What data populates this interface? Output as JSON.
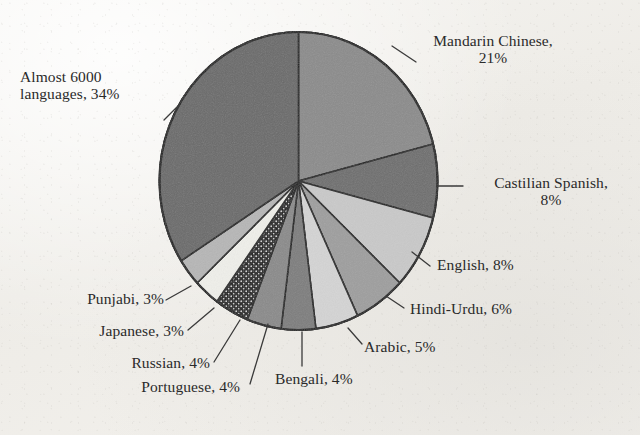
{
  "chart_data": {
    "type": "pie",
    "title": "",
    "subtitle": "",
    "xlabel": "",
    "ylabel": "",
    "legend_position": "callout-labels",
    "grid": false,
    "units": "percent",
    "start_angle_deg": 0,
    "direction": "clockwise",
    "categories": [
      "Mandarin Chinese",
      "Castilian Spanish",
      "English",
      "Hindi-Urdu",
      "Arabic",
      "Bengali",
      "Portuguese",
      "Russian",
      "Japanese",
      "Punjabi",
      "Almost 6000 languages"
    ],
    "values": [
      21,
      8,
      8,
      6,
      5,
      4,
      4,
      4,
      3,
      3,
      34
    ],
    "slices": [
      {
        "label": "Mandarin Chinese",
        "value": 21,
        "text": "Mandarin Chinese,",
        "text2": "21%",
        "fill": "#8b8b8b",
        "pattern": "solid"
      },
      {
        "label": "Castilian Spanish",
        "value": 8,
        "text": "Castilian Spanish,",
        "text2": "8%",
        "fill": "#6e6e6e",
        "pattern": "solid"
      },
      {
        "label": "English",
        "value": 8,
        "text": "English, 8%",
        "text2": "",
        "fill": "#c9c9c9",
        "pattern": "solid"
      },
      {
        "label": "Hindi-Urdu",
        "value": 6,
        "text": "Hindi-Urdu, 6%",
        "text2": "",
        "fill": "#9e9e9e",
        "pattern": "solid"
      },
      {
        "label": "Arabic",
        "value": 5,
        "text": "Arabic, 5%",
        "text2": "",
        "fill": "#d4d4d4",
        "pattern": "solid"
      },
      {
        "label": "Bengali",
        "value": 4,
        "text": "Bengali, 4%",
        "text2": "",
        "fill": "#7d7d7d",
        "pattern": "solid"
      },
      {
        "label": "Portuguese",
        "value": 4,
        "text": "Portuguese, 4%",
        "text2": "",
        "fill": "#8a8a8a",
        "pattern": "solid"
      },
      {
        "label": "Russian",
        "value": 4,
        "text": "Russian, 4%",
        "text2": "",
        "fill": "#1a1a1a",
        "pattern": "dotted-black"
      },
      {
        "label": "Japanese",
        "value": 3,
        "text": "Japanese, 3%",
        "text2": "",
        "fill": "#efefea",
        "pattern": "solid"
      },
      {
        "label": "Punjabi",
        "value": 3,
        "text": "Punjabi, 3%",
        "text2": "",
        "fill": "#b6b6b6",
        "pattern": "solid"
      },
      {
        "label": "Almost 6000 languages",
        "value": 34,
        "text": "Almost 6000",
        "text2": "languages, 34%",
        "fill": "#6a6a6a",
        "pattern": "solid"
      }
    ]
  },
  "labels": {
    "mandarin_line1": "Mandarin Chinese,",
    "mandarin_line2": "21%",
    "almost_line1": "Almost 6000",
    "almost_line2": "languages, 34%",
    "castilian_line1": "Castilian Spanish,",
    "castilian_line2": "8%",
    "english": "English, 8%",
    "hindi_urdu": "Hindi-Urdu, 6%",
    "arabic": "Arabic, 5%",
    "bengali": "Bengali, 4%",
    "portuguese": "Portuguese, 4%",
    "russian": "Russian, 4%",
    "japanese": "Japanese, 3%",
    "punjabi": "Punjabi, 3%"
  },
  "colors": {
    "background": "#f2f1ee",
    "outline": "#1c1c1c",
    "text": "#2a2a2a",
    "leader_line": "#3a3a3a"
  }
}
